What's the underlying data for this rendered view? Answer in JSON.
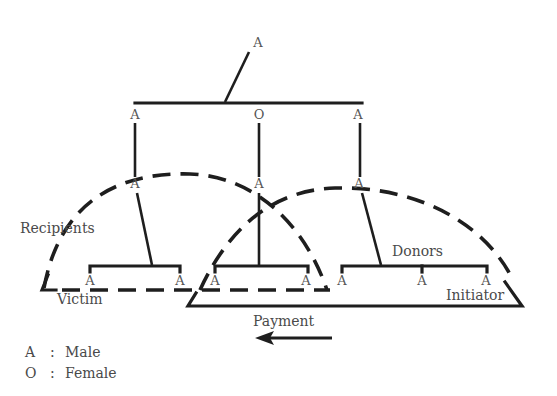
{
  "diagram": {
    "nodes": {
      "top": {
        "symbol": "A",
        "x": 258,
        "y": 47
      },
      "gen2": [
        {
          "symbol": "A",
          "x": 135,
          "y": 119
        },
        {
          "symbol": "O",
          "x": 259,
          "y": 119
        },
        {
          "symbol": "A",
          "x": 358,
          "y": 119
        }
      ],
      "gen3": [
        {
          "symbol": "A",
          "x": 135,
          "y": 188
        },
        {
          "symbol": "A",
          "x": 259,
          "y": 188
        },
        {
          "symbol": "A",
          "x": 359,
          "y": 188
        }
      ],
      "gen4_left": [
        {
          "symbol": "A",
          "x": 90,
          "y": 285
        },
        {
          "symbol": "A",
          "x": 180,
          "y": 285
        }
      ],
      "gen4_middle": [
        {
          "symbol": "A",
          "x": 215,
          "y": 285
        },
        {
          "symbol": "A",
          "x": 306,
          "y": 285
        }
      ],
      "gen4_right": [
        {
          "symbol": "A",
          "x": 342,
          "y": 285
        },
        {
          "symbol": "A",
          "x": 422,
          "y": 285
        },
        {
          "symbol": "A",
          "x": 486,
          "y": 285
        }
      ]
    },
    "labels": {
      "recipients": "Recipients",
      "donors": "Donors",
      "victim": "Victim",
      "initiator": "Initiator",
      "payment": "Payment"
    },
    "legend": [
      {
        "symbol": "A",
        "sep": ":",
        "meaning": "Male"
      },
      {
        "symbol": "O",
        "sep": ":",
        "meaning": "Female"
      }
    ]
  }
}
